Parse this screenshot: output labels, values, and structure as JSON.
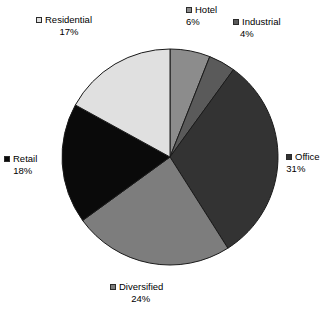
{
  "chart_data": {
    "type": "pie",
    "title": "",
    "labels": [
      "Hotel",
      "Industrial",
      "Office",
      "Diversified",
      "Retail",
      "Residential"
    ],
    "values": [
      6,
      4,
      31,
      24,
      18,
      17
    ],
    "value_labels": [
      "6%",
      "4%",
      "31%",
      "24%",
      "18%",
      "17%"
    ],
    "unit": "%",
    "start_angle_deg": 0,
    "direction": "clockwise",
    "legend": "none",
    "grid": false,
    "slices": [
      {
        "label": "Hotel",
        "value": 6,
        "value_label": "6%",
        "color": "#8c8c8c"
      },
      {
        "label": "Industrial",
        "value": 4,
        "value_label": "4%",
        "color": "#5a5a5a"
      },
      {
        "label": "Office",
        "value": 31,
        "value_label": "31%",
        "color": "#333333"
      },
      {
        "label": "Diversified",
        "value": 24,
        "value_label": "24%",
        "color": "#7d7d7d"
      },
      {
        "label": "Retail",
        "value": 18,
        "value_label": "18%",
        "color": "#0a0a0a"
      },
      {
        "label": "Residential",
        "value": 17,
        "value_label": "17%",
        "color": "#e0e0e0"
      }
    ]
  },
  "figure": {
    "background": "#ffffff",
    "text_color": "#000000",
    "slice_border": "#1a1a1a",
    "center_x": 170,
    "center_y": 157,
    "radius": 108
  },
  "labels": {
    "hotel": {
      "name": "Hotel",
      "pct": "6%",
      "color": "#8c8c8c"
    },
    "industrial": {
      "name": "Industrial",
      "pct": "4%",
      "color": "#5a5a5a"
    },
    "office": {
      "name": "Office",
      "pct": "31%",
      "color": "#333333"
    },
    "diversified": {
      "name": "Diversified",
      "pct": "24%",
      "color": "#7d7d7d"
    },
    "retail": {
      "name": "Retail",
      "pct": "18%",
      "color": "#0a0a0a"
    },
    "residential": {
      "name": "Residential",
      "pct": "17%",
      "color": "#e0e0e0"
    }
  }
}
